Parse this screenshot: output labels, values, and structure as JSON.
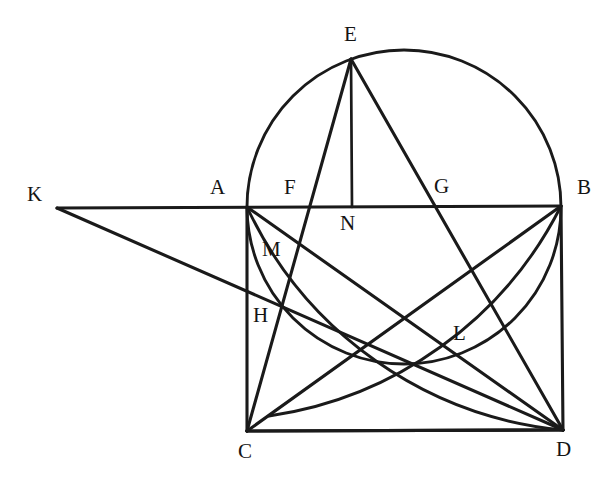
{
  "figure": {
    "domain": "Diagram",
    "kind": "euclidean-geometry-construction",
    "width": 606,
    "height": 485,
    "background_color": "#ffffff",
    "stroke_color": "#1a1a1a",
    "label_color": "#141414"
  },
  "labels": [
    {
      "id": "E",
      "text": "E",
      "x": 344,
      "y": 24,
      "anchor_point": {
        "x": 351,
        "y": 59
      }
    },
    {
      "id": "A",
      "text": "A",
      "x": 210,
      "y": 177,
      "anchor_point": {
        "x": 247,
        "y": 207
      }
    },
    {
      "id": "F",
      "text": "F",
      "x": 284,
      "y": 177,
      "anchor_point": {
        "x": 308,
        "y": 207
      }
    },
    {
      "id": "G",
      "text": "G",
      "x": 434,
      "y": 176,
      "anchor_point": {
        "x": 440,
        "y": 207
      }
    },
    {
      "id": "B",
      "text": "B",
      "x": 577,
      "y": 177,
      "anchor_point": {
        "x": 561,
        "y": 206
      }
    },
    {
      "id": "K",
      "text": "K",
      "x": 27,
      "y": 184,
      "anchor_point": {
        "x": 57,
        "y": 208
      }
    },
    {
      "id": "N",
      "text": "N",
      "x": 340,
      "y": 213,
      "anchor_point": {
        "x": 352,
        "y": 207
      }
    },
    {
      "id": "M",
      "text": "M",
      "x": 262,
      "y": 239,
      "anchor_point": {
        "x": 288,
        "y": 258
      }
    },
    {
      "id": "H",
      "text": "H",
      "x": 253,
      "y": 305,
      "anchor_point": {
        "x": 281,
        "y": 311
      }
    },
    {
      "id": "L",
      "text": "L",
      "x": 453,
      "y": 323,
      "anchor_point": {
        "x": 464,
        "y": 348
      }
    },
    {
      "id": "C",
      "text": "C",
      "x": 238,
      "y": 441,
      "anchor_point": {
        "x": 247,
        "y": 431
      }
    },
    {
      "id": "D",
      "text": "D",
      "x": 556,
      "y": 439,
      "anchor_point": {
        "x": 563,
        "y": 430
      }
    }
  ],
  "points": {
    "A": {
      "x": 247,
      "y": 207
    },
    "B": {
      "x": 561,
      "y": 206
    },
    "C": {
      "x": 247,
      "y": 431
    },
    "D": {
      "x": 563,
      "y": 430
    },
    "E": {
      "x": 351,
      "y": 59
    },
    "F": {
      "x": 308,
      "y": 207
    },
    "G": {
      "x": 440,
      "y": 207
    },
    "H": {
      "x": 281,
      "y": 311
    },
    "K": {
      "x": 57,
      "y": 208
    },
    "L": {
      "x": 461,
      "y": 349
    },
    "M": {
      "x": 288,
      "y": 258
    },
    "N": {
      "x": 352,
      "y": 207
    }
  },
  "circle": {
    "name": "main-circle",
    "center": {
      "x": 404,
      "y": 207
    },
    "radius": 157,
    "passes_through": [
      "A",
      "B",
      "E"
    ]
  },
  "arcs": [
    {
      "name": "arc-A-H-D",
      "center": {
        "x": 563,
        "y": 430
      },
      "radius": 389,
      "from": {
        "x": 247,
        "y": 207
      },
      "to": {
        "x": 563,
        "y": 430
      },
      "description": "arc centred at D from A sweeping through H down to D"
    },
    {
      "name": "arc-C-L-B",
      "center": {
        "x": 247,
        "y": 431
      },
      "radius": 389,
      "from": {
        "x": 247,
        "y": 431
      },
      "to": {
        "x": 561,
        "y": 206
      },
      "description": "arc centred at C from the base rising through L to B"
    }
  ],
  "segments": [
    {
      "name": "segment-K-B",
      "from": "K",
      "to": "B",
      "note": "horizontal baseline through A, F, N, G"
    },
    {
      "name": "segment-K-D",
      "from": "K",
      "to": "D",
      "note": "passes through H"
    },
    {
      "name": "segment-A-C",
      "from": "A",
      "to": "C",
      "note": "left side of rectangle"
    },
    {
      "name": "segment-B-D",
      "from": "B",
      "to": "D",
      "note": "right side of rectangle"
    },
    {
      "name": "segment-C-D",
      "from": "C",
      "to": "D",
      "note": "base of rectangle"
    },
    {
      "name": "segment-E-C",
      "from": "E",
      "to": "C",
      "note": "crosses baseline at F"
    },
    {
      "name": "segment-E-N",
      "from": "E",
      "to": "N",
      "note": "vertical perpendicular from E to AB"
    },
    {
      "name": "segment-E-D",
      "from": "E",
      "to": "D",
      "note": "crosses baseline at G"
    },
    {
      "name": "segment-A-D",
      "from": "A",
      "to": "D",
      "note": "diagonal passing near M"
    },
    {
      "name": "segment-C-B",
      "from": "C",
      "to": "B",
      "note": "diagonal rising to B through the L region"
    }
  ]
}
